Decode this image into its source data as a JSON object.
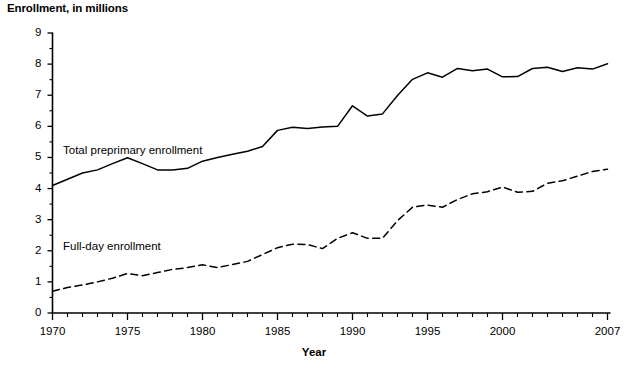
{
  "chart_data": {
    "type": "line",
    "title": "Enrollment, in millions",
    "xlabel": "Year",
    "ylabel": "",
    "xlim": [
      1970,
      2007
    ],
    "ylim": [
      0,
      9
    ],
    "grid": false,
    "legend_position": "inline-annotation",
    "y_ticks": [
      "0",
      "1",
      "2",
      "3",
      "4",
      "5",
      "6",
      "7",
      "8",
      "9"
    ],
    "y_tick_values": [
      0,
      1,
      2,
      3,
      4,
      5,
      6,
      7,
      8,
      9
    ],
    "x_ticks": [
      "1970",
      "1975",
      "1980",
      "1985",
      "1990",
      "1995",
      "2000",
      "2007"
    ],
    "x_tick_values": [
      1970,
      1975,
      1980,
      1985,
      1990,
      1995,
      2000,
      2007
    ],
    "x_minor_tick_interval": 1,
    "x": [
      1970,
      1971,
      1972,
      1973,
      1974,
      1975,
      1976,
      1977,
      1978,
      1979,
      1980,
      1981,
      1982,
      1983,
      1984,
      1985,
      1986,
      1987,
      1988,
      1989,
      1990,
      1991,
      1992,
      1993,
      1994,
      1995,
      1996,
      1997,
      1998,
      1999,
      2000,
      2001,
      2002,
      2003,
      2004,
      2005,
      2006,
      2007
    ],
    "series": [
      {
        "name": "Total preprimary enrollment",
        "style": "solid",
        "color": "#000000",
        "label_x": 1970.7,
        "label_y": 5.22,
        "values": [
          4.1,
          4.3,
          4.5,
          4.6,
          4.8,
          4.99,
          4.8,
          4.6,
          4.6,
          4.65,
          4.88,
          5.0,
          5.1,
          5.2,
          5.35,
          5.87,
          5.97,
          5.93,
          5.98,
          6.0,
          6.66,
          6.33,
          6.4,
          6.99,
          7.51,
          7.72,
          7.58,
          7.86,
          7.79,
          7.84,
          7.59,
          7.6,
          7.86,
          7.9,
          7.76,
          7.88,
          7.84,
          8.01
        ]
      },
      {
        "name": "Full-day enrollment",
        "style": "dashed",
        "color": "#000000",
        "label_x": 1970.7,
        "label_y": 2.12,
        "values": [
          0.7,
          0.82,
          0.9,
          1.0,
          1.12,
          1.27,
          1.2,
          1.3,
          1.4,
          1.46,
          1.55,
          1.46,
          1.56,
          1.66,
          1.88,
          2.1,
          2.21,
          2.2,
          2.07,
          2.4,
          2.58,
          2.4,
          2.4,
          2.97,
          3.4,
          3.47,
          3.4,
          3.65,
          3.83,
          3.9,
          4.05,
          3.88,
          3.91,
          4.17,
          4.25,
          4.4,
          4.55,
          4.62
        ]
      }
    ]
  }
}
